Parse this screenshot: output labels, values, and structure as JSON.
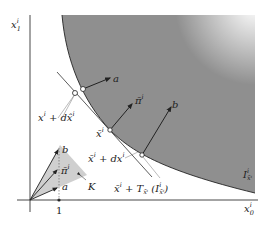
{
  "figure": {
    "type": "diagram",
    "axes": {
      "x_label": "x₀ⁱ",
      "y_label": "x₁ⁱ",
      "x_tick": "1"
    },
    "region_label": "Iⁱ x̄ⁱ",
    "points": {
      "x_dx_hat": "xⁱ + dx̂ⁱ",
      "x_bar": "x̄ⁱ",
      "x_bar_dx": "x̄ⁱ + dxⁱ",
      "tangent": "x̄ⁱ + T x̄ⁱ (Iⁱ x̄ⁱ)"
    },
    "vectors": {
      "a": "a",
      "b": "b",
      "pi_bar": "π̄ⁱ"
    },
    "cone_label": "K",
    "colors": {
      "region_fill": "#8c8c8c",
      "cone_fill": "#cfcfcf",
      "line": "#222222"
    }
  }
}
